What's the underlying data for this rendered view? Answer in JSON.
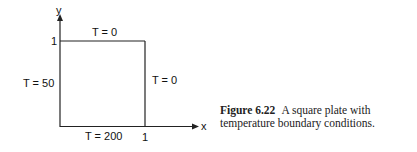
{
  "diagram": {
    "axes": {
      "x_label": "x",
      "y_label": "y",
      "x_tick": "1",
      "y_tick": "1"
    },
    "boundaries": {
      "top": "T = 0",
      "right": "T = 0",
      "left": "T = 50",
      "bottom": "T = 200"
    }
  },
  "caption": {
    "figure_number": "Figure 6.22",
    "text": "A square plate with temperature boundary conditions."
  }
}
